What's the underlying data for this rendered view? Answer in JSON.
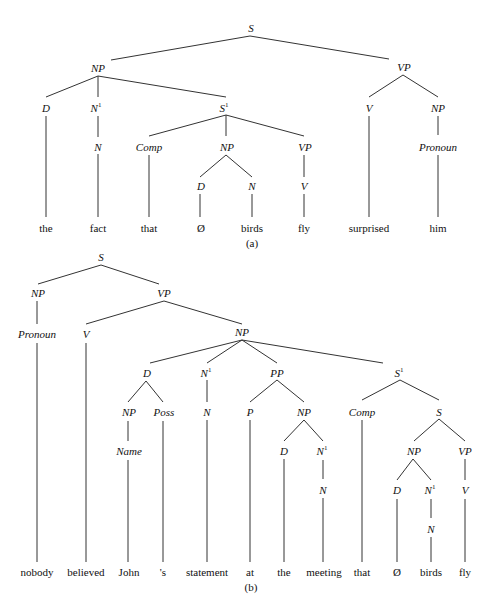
{
  "trees": [
    {
      "id": "a",
      "caption": "(a)",
      "sentence": "the fact that Ø birds fly surprised him",
      "nodes": {
        "S": {
          "label": "S"
        },
        "NP": {
          "label": "NP"
        },
        "VP": {
          "label": "VP"
        },
        "D": {
          "label": "D"
        },
        "N1": {
          "label": "N",
          "sup": "1"
        },
        "S1": {
          "label": "S",
          "sup": "1"
        },
        "N": {
          "label": "N"
        },
        "Comp": {
          "label": "Comp"
        },
        "NP2": {
          "label": "NP"
        },
        "VP2": {
          "label": "VP"
        },
        "D2": {
          "label": "D"
        },
        "N2": {
          "label": "N"
        },
        "V2": {
          "label": "V"
        },
        "V": {
          "label": "V"
        },
        "NP3": {
          "label": "NP"
        },
        "Pronoun": {
          "label": "Pronoun"
        }
      },
      "words": [
        "the",
        "fact",
        "that",
        "Ø",
        "birds",
        "fly",
        "surprised",
        "him"
      ]
    },
    {
      "id": "b",
      "caption": "(b)",
      "sentence": "nobody believed John 's statement at the meeting that Ø birds fly",
      "nodes": {
        "S": {
          "label": "S"
        },
        "NP": {
          "label": "NP"
        },
        "VP": {
          "label": "VP"
        },
        "Pronoun": {
          "label": "Pronoun"
        },
        "V": {
          "label": "V"
        },
        "NP2": {
          "label": "NP"
        },
        "D": {
          "label": "D"
        },
        "N1": {
          "label": "N",
          "sup": "1"
        },
        "PP": {
          "label": "PP"
        },
        "S1": {
          "label": "S",
          "sup": "1"
        },
        "NP3": {
          "label": "NP"
        },
        "Poss": {
          "label": "Poss"
        },
        "Name": {
          "label": "Name"
        },
        "N": {
          "label": "N"
        },
        "P": {
          "label": "P"
        },
        "NP4": {
          "label": "NP"
        },
        "D2": {
          "label": "D"
        },
        "N1b": {
          "label": "N",
          "sup": "1"
        },
        "Nb": {
          "label": "N"
        },
        "Comp": {
          "label": "Comp"
        },
        "S2": {
          "label": "S"
        },
        "NP5": {
          "label": "NP"
        },
        "VP2": {
          "label": "VP"
        },
        "D3": {
          "label": "D"
        },
        "N1c": {
          "label": "N",
          "sup": "1"
        },
        "Nc": {
          "label": "N"
        },
        "V2": {
          "label": "V"
        }
      },
      "words": [
        "nobody",
        "believed",
        "John",
        "'s",
        "statement",
        "at",
        "the",
        "meeting",
        "that",
        "Ø",
        "birds",
        "fly"
      ]
    }
  ]
}
